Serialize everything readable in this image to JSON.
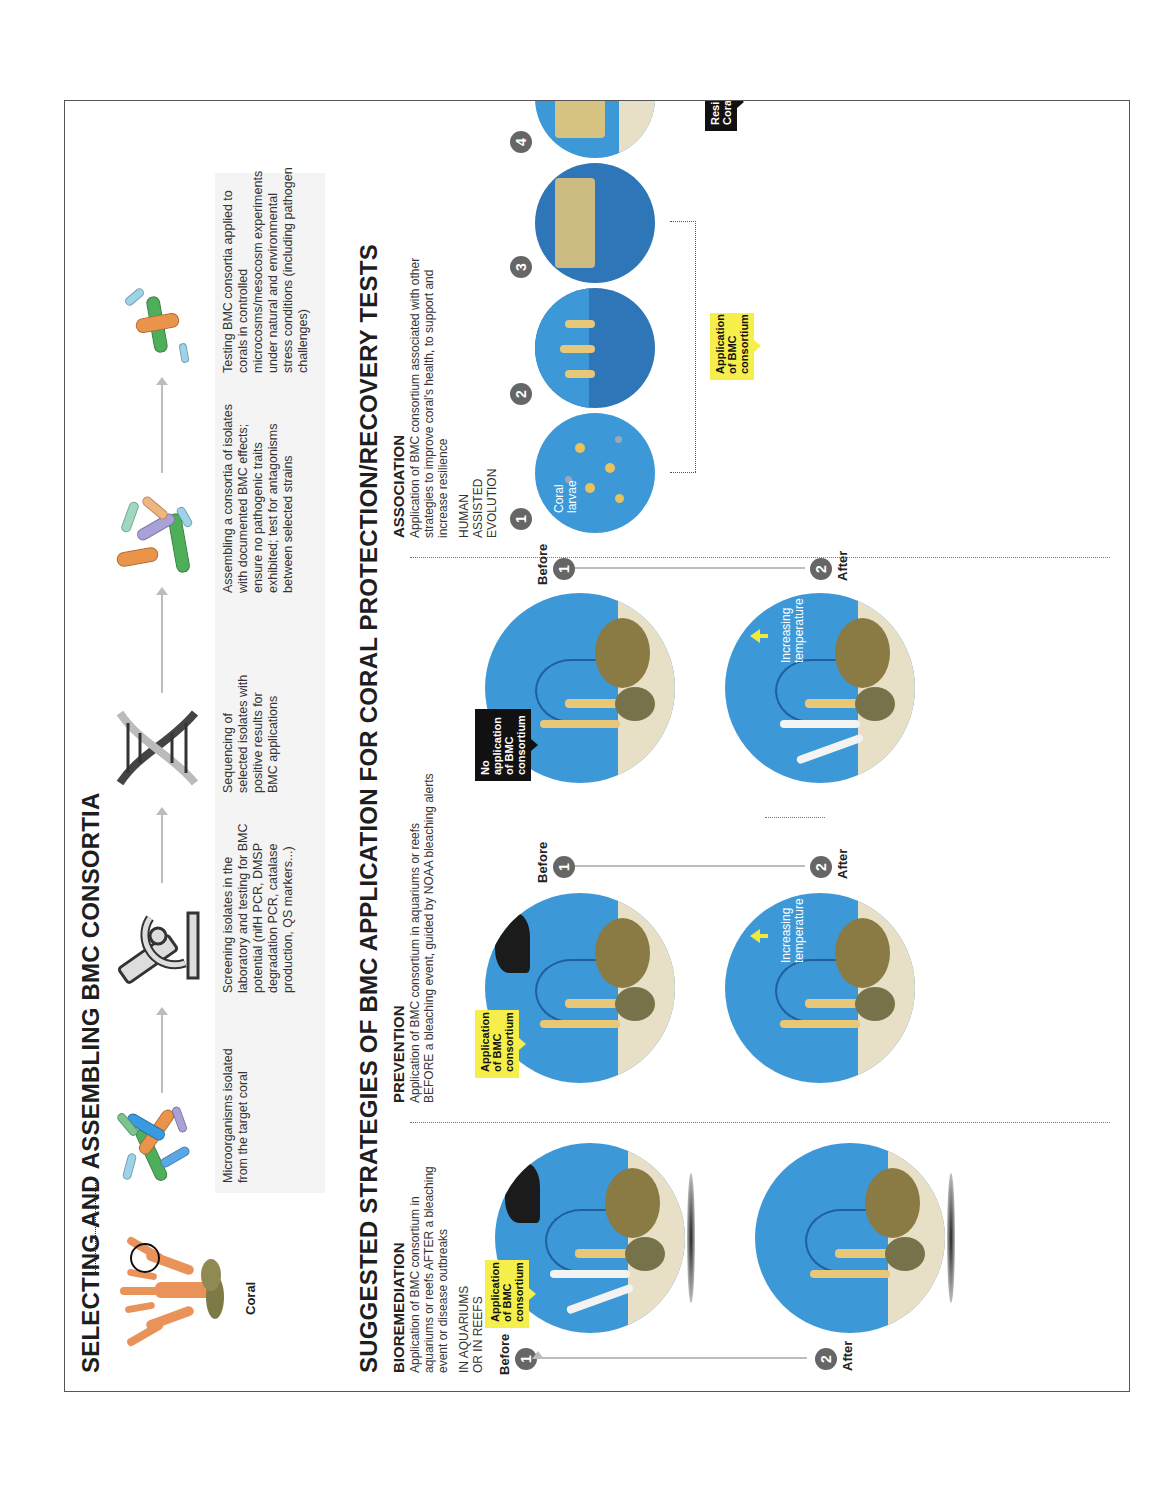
{
  "figure": {
    "orientation": "rotated 90 degrees counter-clockwise",
    "section_selecting": {
      "title": "SELECTING AND ASSEMBLING BMC CONSORTIA",
      "coral_label": "Coral",
      "steps": [
        {
          "icon": "microorganisms-icon",
          "text": "Microorganisms isolated from the target coral"
        },
        {
          "icon": "microscope-icon",
          "text": "Screening isolates in the laboratory and testing for BMC potential (nifH PCR, DMSP degradation PCR, catalase production, QS markers...)"
        },
        {
          "icon": "dna-icon",
          "text": "Sequencing of selected isolates with positive results for BMC applications"
        },
        {
          "icon": "bacteria-consortium-icon",
          "text": "Assembling a consortia of isolates with documented BMC effects; ensure no pathogenic traits exhibited; test for antagonisms between selected strains"
        },
        {
          "icon": "bacteria-test-icon",
          "text": "Testing BMC consortia applied to corals in controlled microcosms/mesocosm experiments under natural and environmental stress conditions (including pathogen challenges)"
        }
      ]
    },
    "section_strategies": {
      "title": "SUGGESTED STRATEGIES OF BMC APPLICATION FOR CORAL PROTECTION/RECOVERY TESTS",
      "bioremediation": {
        "title": "BIOREMEDIATION",
        "description": "Application of BMC consortium in aquariums or reefs AFTER a bleaching event or disease outbreaks",
        "setting": "IN AQUARIUMS OR IN REEFS",
        "before_label": "Before",
        "after_label": "After",
        "step1": "1",
        "step2": "2",
        "tag": "Application of BMC consortium"
      },
      "prevention": {
        "title": "PREVENTION",
        "description": "Application of BMC consortium in aquariums or reefs BEFORE a bleaching event, guided by NOAA bleaching alerts",
        "rows": [
          {
            "tag": "Application of BMC consortium",
            "tag_style": "yellow",
            "before_label": "Before",
            "after_label": "After",
            "step1": "1",
            "step2": "2",
            "temp_label": "Increasing temperature"
          },
          {
            "tag": "No application of BMC consortium",
            "tag_style": "black",
            "before_label": "Before",
            "after_label": "After",
            "step1": "1",
            "step2": "2",
            "temp_label": "Increasing temperature"
          }
        ]
      },
      "association": {
        "title": "ASSOCIATION",
        "description": "Application of BMC consortium associated with other strategies to improve coral's health, to support and increase resilience",
        "subtitle": "HUMAN ASSISTED EVOLUTION",
        "larvae_label": "Coral larvae",
        "tag": "Application of BMC consortium",
        "result_tag": "Resilient Corals",
        "steps": [
          "1",
          "2",
          "3",
          "4"
        ]
      }
    },
    "colors": {
      "water": "#3d98d8",
      "sand": "#e7dfc6",
      "coral_orange": "#e9935a",
      "tag_yellow": "#f6ee4b",
      "tag_black": "#111111",
      "step_badge": "#666666"
    }
  }
}
